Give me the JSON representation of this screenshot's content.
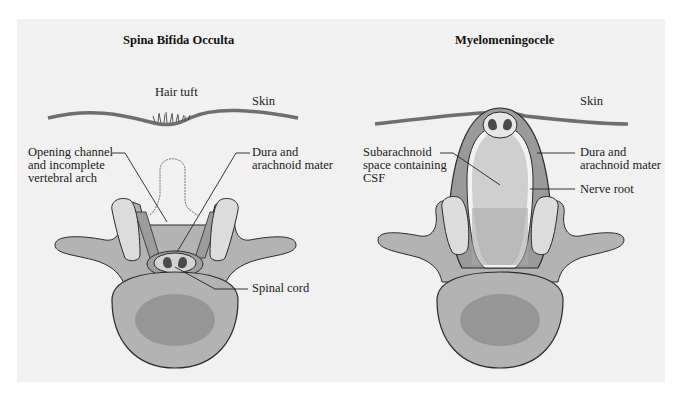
{
  "figure": {
    "left_panel": {
      "title": "Spina Bifida Occulta",
      "labels": {
        "hair_tuft": "Hair tuft",
        "skin": "Skin",
        "opening_channel": "Opening channel\nand incomplete\nvertebral arch",
        "dura": "Dura and\narachnoid mater",
        "spinal_cord": "Spinal cord"
      }
    },
    "right_panel": {
      "title": "Myelomeningocele",
      "labels": {
        "skin": "Skin",
        "subarachnoid": "Subarachnoid\nspace containing\nCSF",
        "dura": "Dura and\narachnoid mater",
        "nerve_root": "Nerve root"
      }
    },
    "colors": {
      "background": "#f1f1f1",
      "bone_light": "#dcdcdc",
      "bone_mid": "#b8b8b8",
      "bone_dark": "#9a9a9a",
      "body_center": "#8e8e8e",
      "outline": "#2a2a2a"
    }
  }
}
